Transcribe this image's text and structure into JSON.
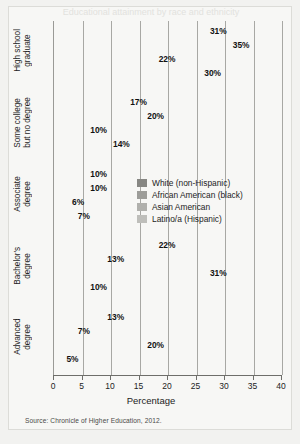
{
  "figure": {
    "title_fragment": "Educational attainment by race and ethnicity",
    "source": "Source: Chronicle of Higher Education, 2012."
  },
  "chart_data": {
    "type": "bar",
    "orientation": "horizontal",
    "title": "",
    "xlabel": "Percentage",
    "ylabel": "",
    "xlim": [
      0,
      40
    ],
    "xticks": [
      "0",
      "5",
      "10",
      "15",
      "20",
      "25",
      "30",
      "35",
      "40"
    ],
    "grid": true,
    "legend_position": "center-right inside plot",
    "categories": [
      "High school graduate",
      "Some college but no degree",
      "Associate degree",
      "Bachelor's degree",
      "Advanced degree"
    ],
    "category_lines": [
      [
        "High school",
        "graduate"
      ],
      [
        "Some college",
        "but no degree"
      ],
      [
        "Associate",
        "degree"
      ],
      [
        "Bachelor's",
        "degree"
      ],
      [
        "Advanced",
        "degree"
      ]
    ],
    "series": [
      {
        "name": "White (non-Hispanic)",
        "color": "#878783",
        "values": [
          31,
          17,
          10,
          22,
          13
        ],
        "labels": [
          "31%",
          "17%",
          "10%",
          "22%",
          "13%"
        ]
      },
      {
        "name": "African American (black)",
        "color": "#9d9d99",
        "values": [
          35,
          20,
          10,
          13,
          7
        ],
        "labels": [
          "35%",
          "20%",
          "10%",
          "13%",
          "7%"
        ]
      },
      {
        "name": "Asian American",
        "color": "#b0b0ac",
        "values": [
          22,
          10,
          6,
          31,
          20
        ],
        "labels": [
          "22%",
          "10%",
          "6%",
          "31%",
          "20%"
        ]
      },
      {
        "name": "Latino/a (Hispanic)",
        "color": "#bebeba",
        "values": [
          30,
          14,
          7,
          10,
          5
        ],
        "labels": [
          "30%",
          "14%",
          "7%",
          "10%",
          "5%"
        ]
      }
    ]
  }
}
